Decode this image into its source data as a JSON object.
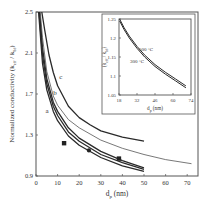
{
  "chart_data": [
    {
      "type": "line",
      "title": "",
      "xlabel": "d_p (nm)",
      "ylabel": "Normalized conductivity (k_eff / k_bf)",
      "xlim": [
        0,
        75
      ],
      "ylim": [
        0.9,
        2.5
      ],
      "xticks": [
        0,
        10,
        20,
        30,
        40,
        50,
        60,
        70
      ],
      "yticks": [
        0.9,
        1.3,
        1.7,
        2.1,
        2.5
      ],
      "xtick_labels": [
        "0",
        "10",
        "20",
        "30",
        "40",
        "50",
        "60",
        "70"
      ],
      "ytick_labels": [
        "0.9",
        "1.3",
        "1.7",
        "2.1",
        "2.5"
      ],
      "grid": false,
      "series": [
        {
          "name": "c",
          "label": "c",
          "x": [
            2.7,
            4,
            6,
            8,
            10,
            15,
            20,
            25,
            30,
            40,
            50
          ],
          "y": [
            2.5,
            2.33,
            2.08,
            1.91,
            1.78,
            1.58,
            1.47,
            1.4,
            1.34,
            1.28,
            1.24
          ]
        },
        {
          "name": "thin",
          "label": "",
          "x": [
            2.0,
            3,
            5,
            8,
            10,
            15,
            20,
            30,
            40,
            50,
            60,
            72
          ],
          "y": [
            2.5,
            2.25,
            1.92,
            1.68,
            1.59,
            1.45,
            1.37,
            1.25,
            1.17,
            1.11,
            1.06,
            1.02
          ]
        },
        {
          "name": "b",
          "label": "b",
          "x": [
            1.6,
            3,
            5,
            8,
            10,
            15,
            20,
            30,
            40,
            50
          ],
          "y": [
            2.5,
            2.15,
            1.85,
            1.62,
            1.53,
            1.37,
            1.27,
            1.14,
            1.05,
            0.98
          ]
        },
        {
          "name": "a-upper",
          "label": "",
          "x": [
            1.4,
            3,
            5,
            8,
            10,
            15,
            20,
            30,
            40,
            50
          ],
          "y": [
            2.5,
            2.08,
            1.8,
            1.58,
            1.49,
            1.33,
            1.24,
            1.11,
            1.03,
            0.965
          ]
        },
        {
          "name": "a",
          "label": "a",
          "x": [
            1.2,
            3,
            5,
            8,
            10,
            15,
            20,
            30,
            40,
            50
          ],
          "y": [
            2.5,
            2.0,
            1.74,
            1.53,
            1.44,
            1.29,
            1.2,
            1.08,
            1.0,
            0.945
          ]
        }
      ],
      "points": [
        {
          "marker": "square",
          "x": 13,
          "y": 1.22
        },
        {
          "marker": "circle",
          "x": 24.5,
          "y": 1.15
        },
        {
          "marker": "square",
          "x": 38.4,
          "y": 1.07
        }
      ],
      "annotations": [
        {
          "text": "c",
          "x": 11.5,
          "y": 1.85
        },
        {
          "text": "b",
          "x": 8.8,
          "y": 1.69
        },
        {
          "text": "a",
          "x": 5.1,
          "y": 1.51
        }
      ]
    },
    {
      "type": "line",
      "title": "inset",
      "xlabel": "d_p (nm)",
      "ylabel": "(k_eff / k_bf)",
      "xlim": [
        18,
        74
      ],
      "ylim": [
        1.05,
        1.25
      ],
      "xticks": [
        18,
        32,
        46,
        60,
        74
      ],
      "yticks": [
        1.05,
        1.1,
        1.15,
        1.2,
        1.25
      ],
      "xtick_labels": [
        "18",
        "32",
        "46",
        "60",
        "74"
      ],
      "ytick_labels": [
        "1.05",
        "1.1",
        "1.15",
        "1.2",
        "1.25"
      ],
      "grid": false,
      "series": [
        {
          "name": "500 °C",
          "x": [
            18.5,
            22,
            26,
            32,
            38,
            46,
            54,
            62,
            70
          ],
          "y": [
            1.25,
            1.227,
            1.205,
            1.178,
            1.155,
            1.13,
            1.11,
            1.092,
            1.074
          ]
        },
        {
          "name": "300 °C",
          "x": [
            18.5,
            22,
            26,
            32,
            38,
            46,
            54,
            62,
            70
          ],
          "y": [
            1.245,
            1.222,
            1.2,
            1.173,
            1.15,
            1.125,
            1.105,
            1.087,
            1.069
          ]
        }
      ],
      "annotations": [
        {
          "text": "500 °C",
          "x": 39,
          "y": 1.165
        },
        {
          "text": "300 °C",
          "x": 32,
          "y": 1.135
        }
      ]
    }
  ],
  "labels": {
    "xlabel_main": "d",
    "xlabel_sub": "p",
    "xlabel_unit": " (nm)",
    "ylabel_main": "Normalized conductivity (k",
    "ylabel_sub1": "eff",
    "ylabel_mid": " / k",
    "ylabel_sub2": "bf",
    "ylabel_end": ")",
    "inset_ylabel_a": "(k",
    "inset_ylabel_sub1": "eff",
    "inset_ylabel_mid": " / k",
    "inset_ylabel_sub2": "bf",
    "inset_ylabel_end": ")",
    "inset_xlabel_main": "d",
    "inset_xlabel_sub": "p",
    "inset_xlabel_unit": " (nm)"
  }
}
